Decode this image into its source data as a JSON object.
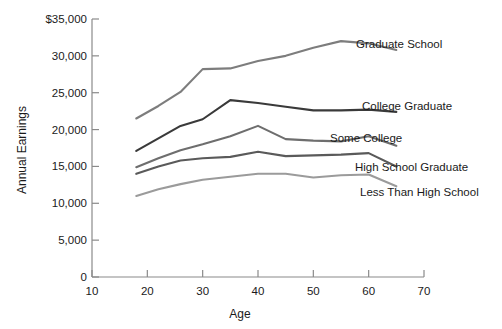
{
  "chart_data": {
    "type": "line",
    "title": "",
    "xlabel": "Age",
    "ylabel": "Annual Earnings",
    "xlim": [
      10,
      70
    ],
    "ylim": [
      0,
      35000
    ],
    "grid": false,
    "legend_position": "right-inline-labels",
    "x_ticks": [
      "10",
      "20",
      "30",
      "40",
      "50",
      "60",
      "70"
    ],
    "x_tick_values": [
      10,
      20,
      30,
      40,
      50,
      60,
      70
    ],
    "y_ticks": [
      "0",
      "5,000",
      "10,000",
      "15,000",
      "20,000",
      "25,000",
      "30,000",
      "$35,000"
    ],
    "y_tick_values": [
      0,
      5000,
      10000,
      15000,
      20000,
      25000,
      30000,
      35000
    ],
    "x": [
      18,
      22,
      26,
      30,
      35,
      40,
      45,
      50,
      55,
      60,
      65
    ],
    "series": [
      {
        "name": "Graduate School",
        "color": "#7d7d7d",
        "values": [
          21500,
          23200,
          25100,
          28200,
          28300,
          29300,
          30000,
          31100,
          32000,
          31700,
          30800
        ]
      },
      {
        "name": "College Graduate",
        "color": "#3a3a3a",
        "values": [
          17100,
          18800,
          20500,
          21400,
          24000,
          23600,
          23100,
          22600,
          22600,
          22700,
          22400
        ]
      },
      {
        "name": "Some College",
        "color": "#6e6e6e",
        "values": [
          14900,
          16100,
          17200,
          18000,
          19100,
          20500,
          18700,
          18500,
          18400,
          19100,
          17800
        ]
      },
      {
        "name": "High School Graduate",
        "color": "#5a5a5a",
        "values": [
          14000,
          15000,
          15800,
          16100,
          16300,
          17000,
          16400,
          16500,
          16600,
          16800,
          15000
        ]
      },
      {
        "name": "Less Than High School",
        "color": "#9b9b9b",
        "values": [
          11000,
          11900,
          12600,
          13200,
          13600,
          14000,
          14000,
          13500,
          13800,
          13900,
          12300
        ]
      }
    ]
  },
  "axes": {
    "y_title": "Annual Earnings",
    "x_title": "Age"
  }
}
